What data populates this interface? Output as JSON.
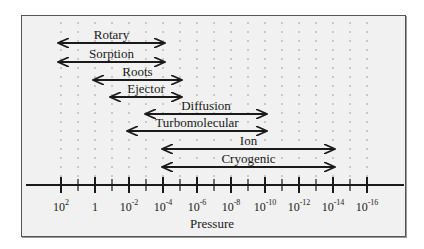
{
  "chart_data": {
    "type": "range-diagram",
    "title": "",
    "xlabel": "Pressure",
    "x_scale": "log10, decreasing left to right",
    "tick_labels": [
      "10^2",
      "1",
      "10^-2",
      "10^-4",
      "10^-6",
      "10^-8",
      "10^-10",
      "10^-12",
      "10^-14",
      "10^-16"
    ],
    "tick_exponents": [
      2,
      0,
      -2,
      -4,
      -6,
      -8,
      -10,
      -12,
      -14,
      -16
    ],
    "minor_ticks": "every odd decade",
    "grid": "dotted vertical lines at every decade",
    "ranges": [
      {
        "name": "Rotary",
        "from_exp": 2.2,
        "to_exp": -4.0
      },
      {
        "name": "Sorption",
        "from_exp": 2.2,
        "to_exp": -4.0
      },
      {
        "name": "Roots",
        "from_exp": 0.1,
        "to_exp": -5.0
      },
      {
        "name": "Ejector",
        "from_exp": -1.0,
        "to_exp": -5.0
      },
      {
        "name": "Diffusion",
        "from_exp": -3.0,
        "to_exp": -10.0
      },
      {
        "name": "Turbomolecular",
        "from_exp": -2.0,
        "to_exp": -10.0
      },
      {
        "name": "Ion",
        "from_exp": -4.0,
        "to_exp": -14.0
      },
      {
        "name": "Cryogenic",
        "from_exp": -4.0,
        "to_exp": -14.0
      }
    ]
  },
  "axis": {
    "label": "Pressure",
    "ticks": [
      {
        "base": "10",
        "exp": "2"
      },
      {
        "base": "1",
        "exp": ""
      },
      {
        "base": "10",
        "exp": "-2"
      },
      {
        "base": "10",
        "exp": "-4"
      },
      {
        "base": "10",
        "exp": "-6"
      },
      {
        "base": "10",
        "exp": "-8"
      },
      {
        "base": "10",
        "exp": "-10"
      },
      {
        "base": "10",
        "exp": "-12"
      },
      {
        "base": "10",
        "exp": "-14"
      },
      {
        "base": "10",
        "exp": "-16"
      }
    ]
  },
  "pumps": [
    {
      "label": "Rotary",
      "x1": 58,
      "x2": 165,
      "y": 43
    },
    {
      "label": "Sorption",
      "x1": 58,
      "x2": 165,
      "y": 62
    },
    {
      "label": "Roots",
      "x1": 93,
      "x2": 182,
      "y": 80
    },
    {
      "label": "Ejector",
      "x1": 110,
      "x2": 182,
      "y": 97
    },
    {
      "label": "Diffusion",
      "x1": 145,
      "x2": 267,
      "y": 114
    },
    {
      "label": "Turbomolecular",
      "x1": 127,
      "x2": 267,
      "y": 131
    },
    {
      "label": "Ion",
      "x1": 162,
      "x2": 335,
      "y": 149
    },
    {
      "label": "Cryogenic",
      "x1": 162,
      "x2": 335,
      "y": 167
    }
  ]
}
